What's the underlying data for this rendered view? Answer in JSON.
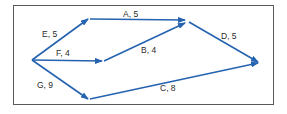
{
  "diagram": {
    "type": "activity-network",
    "arrow_color": "#2563b0",
    "frame_color": "#5a5a5a",
    "nodes": [
      {
        "id": "n1",
        "x": 32,
        "y": 60
      },
      {
        "id": "n2",
        "x": 88,
        "y": 19
      },
      {
        "id": "n3",
        "x": 102,
        "y": 61
      },
      {
        "id": "n4",
        "x": 88,
        "y": 99
      },
      {
        "id": "n5",
        "x": 187,
        "y": 22
      },
      {
        "id": "n6",
        "x": 258,
        "y": 62
      }
    ],
    "edges": [
      {
        "activity": "E",
        "duration": 5,
        "label": "E, 5",
        "from": "n1",
        "to": "n2"
      },
      {
        "activity": "F",
        "duration": 4,
        "label": "F, 4",
        "from": "n1",
        "to": "n3"
      },
      {
        "activity": "G",
        "duration": 9,
        "label": "G, 9",
        "from": "n1",
        "to": "n4"
      },
      {
        "activity": "A",
        "duration": 5,
        "label": "A, 5",
        "from": "n2",
        "to": "n5"
      },
      {
        "activity": "B",
        "duration": 4,
        "label": "B, 4",
        "from": "n3",
        "to": "n5"
      },
      {
        "activity": "D",
        "duration": 5,
        "label": "D, 5",
        "from": "n5",
        "to": "n6"
      },
      {
        "activity": "C",
        "duration": 8,
        "label": "C, 8",
        "from": "n4",
        "to": "n6"
      }
    ]
  },
  "labels": {
    "e": "E, 5",
    "a": "A, 5",
    "f": "F, 4",
    "b": "B, 4",
    "d": "D, 5",
    "g": "G, 9",
    "c": "C, 8"
  }
}
